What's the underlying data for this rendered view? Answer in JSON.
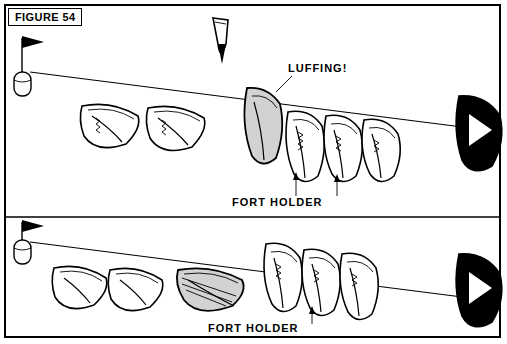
{
  "figure": {
    "label": "FIGURE 54"
  },
  "annotations": {
    "luffing": "LUFFING!",
    "port_holder_top": "FORT HOLDER",
    "port_holder_bottom": "FORT HOLDER"
  },
  "colors": {
    "ink": "#000000",
    "paper": "#ffffff",
    "shaded_hull": "#d2d2d2",
    "dark_hull": "#000000"
  },
  "scenes": [
    {
      "name": "upper-scene",
      "boats": 7,
      "shaded_boat_index": 3,
      "dark_boat_index": 6,
      "has_wind_arrow": true,
      "start_mark": "buoy-with-flag",
      "callout": "LUFFING!"
    },
    {
      "name": "lower-scene",
      "boats": 7,
      "shaded_boat_index": 2,
      "dark_boat_index": 6,
      "has_wind_arrow": false,
      "start_mark": "buoy-with-flag",
      "callout": "FORT HOLDER"
    }
  ]
}
